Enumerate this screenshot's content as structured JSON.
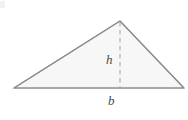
{
  "figure": {
    "name": "triangle-area-diagram",
    "background_color": "#ffffff",
    "stroke_color": "#8e8e8e",
    "fill_color": "#f7f7f7",
    "dash_color": "#a8a8a8",
    "label_color": "#4a4a4a",
    "labels": {
      "height": "h",
      "base": "b"
    },
    "geometry": {
      "left_vertex": [
        14,
        88
      ],
      "right_vertex": [
        184,
        88
      ],
      "apex": [
        120,
        21
      ],
      "foot_of_altitude": [
        120,
        88
      ],
      "base_length_px": 170,
      "height_length_px": 67
    },
    "icons": {
      "dashed_altitude": "dashed-line-icon"
    }
  }
}
